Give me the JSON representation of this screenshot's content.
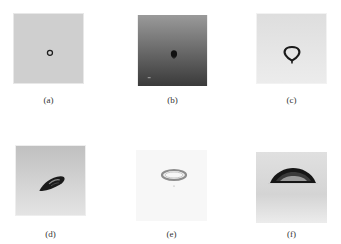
{
  "figure": {
    "panels": [
      {
        "id": "a",
        "label": "(a)",
        "description": "small ring droplet on gray background"
      },
      {
        "id": "b",
        "label": "(b)",
        "description": "dark droplet on dark gradient background"
      },
      {
        "id": "c",
        "label": "(c)",
        "description": "teardrop-shaped ring droplet on light background"
      },
      {
        "id": "d",
        "label": "(d)",
        "description": "tilted elongated dark droplet"
      },
      {
        "id": "e",
        "label": "(e)",
        "description": "faint elliptical ring on near-white background"
      },
      {
        "id": "f",
        "label": "(f)",
        "description": "dome-shaped sessile droplet side view"
      }
    ]
  }
}
